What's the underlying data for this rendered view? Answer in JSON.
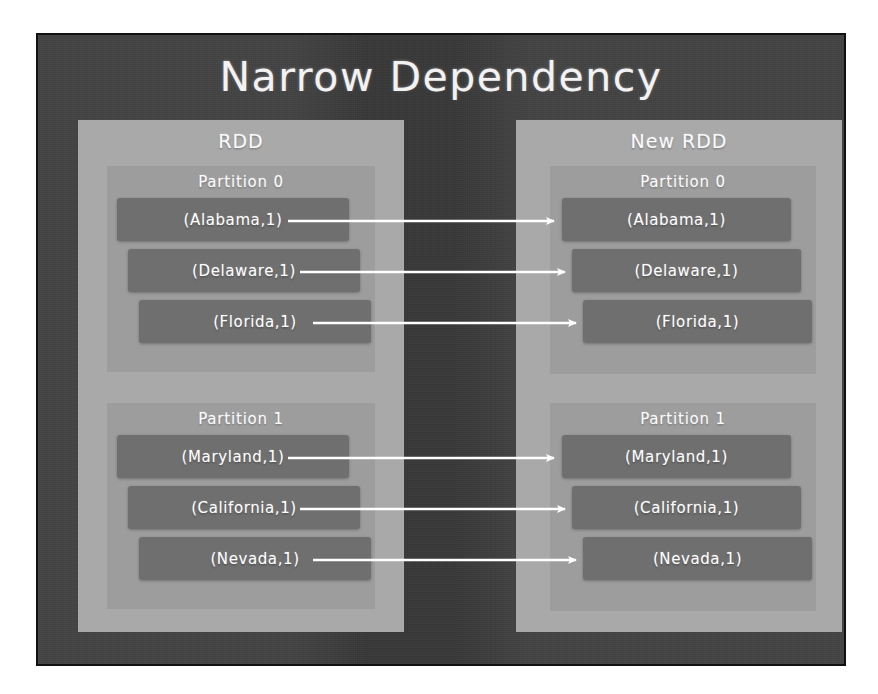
{
  "slide": {
    "title": "Narrow Dependency",
    "background_color": "#434343",
    "panel_color": "#a9a9a9",
    "partition_color": "#9d9d9d",
    "chip_color": "#6f6f6f",
    "text_color": "#ffffff",
    "arrow_color": "#ffffff"
  },
  "source": {
    "panel_title": "RDD",
    "partitions": [
      {
        "title": "Partition 0",
        "records": [
          "(Alabama,1)",
          "(Delaware,1)",
          "(Florida,1)"
        ]
      },
      {
        "title": "Partition 1",
        "records": [
          "(Maryland,1)",
          "(California,1)",
          "(Nevada,1)"
        ]
      }
    ]
  },
  "target": {
    "panel_title": "New RDD",
    "partitions": [
      {
        "title": "Partition 0",
        "records": [
          "(Alabama,1)",
          "(Delaware,1)",
          "(Florida,1)"
        ]
      },
      {
        "title": "Partition 1",
        "records": [
          "(Maryland,1)",
          "(California,1)",
          "(Nevada,1)"
        ]
      }
    ]
  },
  "arrows": [
    {
      "from": "(Alabama,1)",
      "to": "(Alabama,1)"
    },
    {
      "from": "(Delaware,1)",
      "to": "(Delaware,1)"
    },
    {
      "from": "(Florida,1)",
      "to": "(Florida,1)"
    },
    {
      "from": "(Maryland,1)",
      "to": "(Maryland,1)"
    },
    {
      "from": "(California,1)",
      "to": "(California,1)"
    },
    {
      "from": "(Nevada,1)",
      "to": "(Nevada,1)"
    }
  ]
}
